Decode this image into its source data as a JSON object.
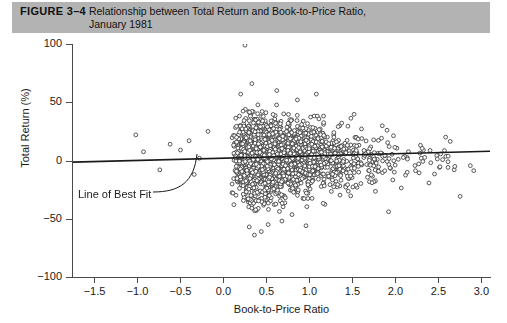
{
  "caption": {
    "figure_label": "FIGURE 3–4",
    "title_line_1": "Relationship between Total Return and Book-to-Price Ratio,",
    "title_line_2": "January 1981",
    "band_color": "#b3b3b3"
  },
  "annotation": {
    "best_fit_label": "Line of Best Fit"
  },
  "chart_data": {
    "type": "scatter",
    "title": "Relationship between Total Return and Book-to-Price Ratio, January 1981",
    "xlabel": "Book-to-Price Ratio",
    "ylabel": "Total Return (%)",
    "xlim": [
      -1.75,
      3.1
    ],
    "ylim": [
      -100,
      100
    ],
    "xticks": [
      -1.5,
      -1.0,
      -0.5,
      0.0,
      0.5,
      1.0,
      1.5,
      2.0,
      2.5,
      3.0
    ],
    "xticklabels": [
      "−1.5",
      "−1.0",
      "−0.5",
      "0.0",
      "0.5",
      "1.0",
      "1.5",
      "2.0",
      "2.5",
      "3.0"
    ],
    "yticks": [
      100,
      50,
      0,
      -50,
      -100
    ],
    "yticklabels": [
      "100",
      "50",
      "0",
      "−50",
      "−100"
    ],
    "grid": false,
    "legend": null,
    "marker": {
      "shape": "open-circle",
      "radius_px": 1.9,
      "stroke": "#3a3a3a",
      "fill": "#ffffff",
      "line_width": 0.85
    },
    "n_points": 2400,
    "point_cloud": {
      "description": "Dense cloud of monthly stock returns concentrated between book-to-price 0.0 and 1.6, centered near 0% total return, with right-skewed long tail toward 3.0 and vertical spread narrowing as ratio increases.",
      "main_cluster": {
        "n": 2180,
        "x_distribution": "lognormal",
        "x_median": 0.62,
        "x_log_sigma": 0.62,
        "x_min": 0.02,
        "x_max": 2.95,
        "y_center": 1.5,
        "y_sigma_at_low_x": 19.0,
        "y_sigma_at_high_x": 11.0
      },
      "sparse_negative_x": {
        "n": 9,
        "points": [
          [
            -1.02,
            22.0
          ],
          [
            -0.93,
            7.5
          ],
          [
            -0.62,
            14.0
          ],
          [
            -0.5,
            9.0
          ],
          [
            -0.4,
            17.0
          ],
          [
            -0.34,
            -12.0
          ],
          [
            -0.28,
            2.0
          ],
          [
            -0.74,
            -8.0
          ],
          [
            -0.18,
            25.0
          ]
        ]
      },
      "high_outliers": {
        "n": 6,
        "points": [
          [
            0.25,
            99.0
          ],
          [
            0.33,
            66.0
          ],
          [
            0.2,
            57.0
          ],
          [
            0.62,
            60.0
          ],
          [
            1.08,
            57.0
          ],
          [
            0.86,
            52.0
          ]
        ]
      },
      "low_outliers": {
        "n": 7,
        "points": [
          [
            0.3,
            -57.0
          ],
          [
            0.44,
            -61.0
          ],
          [
            0.36,
            -64.0
          ],
          [
            0.52,
            -55.0
          ],
          [
            0.96,
            -56.0
          ],
          [
            1.92,
            -44.0
          ],
          [
            0.68,
            -52.0
          ]
        ]
      }
    },
    "best_fit_line": {
      "label": "Line of Best Fit",
      "x_start": -1.75,
      "y_start": -1.4,
      "x_end": 3.1,
      "y_end": 8.0,
      "slope": 1.94,
      "intercept": 2.0,
      "color": "#1a1a1a",
      "width_px": 1.6
    }
  }
}
